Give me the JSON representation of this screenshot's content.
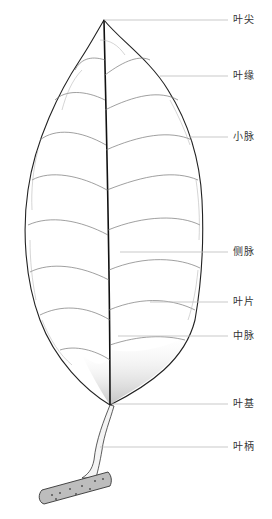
{
  "diagram": {
    "type": "botanical-illustration",
    "labels": [
      {
        "text": "叶尖",
        "y": 20,
        "line_start_x": 104
      },
      {
        "text": "叶缘",
        "y": 76,
        "line_start_x": 160
      },
      {
        "text": "小脉",
        "y": 137,
        "line_start_x": 190
      },
      {
        "text": "侧脉",
        "y": 252,
        "line_start_x": 120
      },
      {
        "text": "叶片",
        "y": 302,
        "line_start_x": 150
      },
      {
        "text": "中脉",
        "y": 336,
        "line_start_x": 118
      },
      {
        "text": "叶基",
        "y": 404,
        "line_start_x": 112
      },
      {
        "text": "叶柄",
        "y": 447,
        "line_start_x": 100
      }
    ],
    "colors": {
      "outline": "#222222",
      "vein": "#888888",
      "leader_line": "#bbbbbb",
      "label_text": "#333333"
    }
  }
}
